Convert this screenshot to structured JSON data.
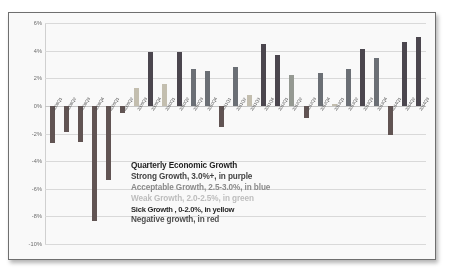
{
  "chart_data": {
    "type": "bar",
    "title": "Quarterly Economic Growth",
    "xlabel": "",
    "ylabel": "",
    "ylim": [
      -10,
      6
    ],
    "grid": true,
    "legend_position": "inside-center",
    "yticks": [
      "6%",
      "4%",
      "2%",
      "0%",
      "-2%",
      "-4%",
      "-6%",
      "-8%",
      "-10%"
    ],
    "ytick_values": [
      6,
      4,
      2,
      0,
      -2,
      -4,
      -6,
      -8,
      -10
    ],
    "categories": [
      "2008Q1",
      "2008Q2",
      "2008Q3",
      "2008Q4",
      "2009Q1",
      "2009Q2",
      "2009Q3",
      "2009Q4",
      "2010Q1",
      "2010Q2",
      "2010Q3",
      "2010Q4",
      "2011Q1",
      "2011Q2",
      "2011Q3",
      "2011Q4",
      "2012Q1",
      "2012Q2",
      "2012Q3",
      "2012Q4",
      "2013Q1",
      "2013Q2",
      "2013Q3",
      "2013Q4",
      "2014Q1",
      "2014Q2",
      "2014Q3"
    ],
    "values": [
      -2.7,
      -1.9,
      -2.6,
      -8.3,
      -5.4,
      -0.5,
      1.3,
      3.9,
      1.6,
      3.9,
      2.7,
      2.5,
      -1.5,
      2.8,
      0.8,
      4.5,
      3.7,
      2.2,
      -0.9,
      2.4,
      0.1,
      2.7,
      4.1,
      3.5,
      -2.1,
      4.6,
      5.0
    ],
    "colors": [
      "#e0302e",
      "#e0302e",
      "#e0302e",
      "#e0302e",
      "#e0302e",
      "#e0302e",
      "#ffc000",
      "#7030a0",
      "#ffc000",
      "#7030a0",
      "#4472c4",
      "#4472c4",
      "#e0302e",
      "#4472c4",
      "#ffc000",
      "#7030a0",
      "#7030a0",
      "#70ad47",
      "#e0302e",
      "#4472c4",
      "#ffc000",
      "#4472c4",
      "#7030a0",
      "#4472c4",
      "#e0302e",
      "#7030a0",
      "#7030a0"
    ],
    "series_legend": [
      {
        "label": "Strong Growth, 3.0%+, in purple",
        "color": "#7030a0",
        "range": "3.0+"
      },
      {
        "label": "Acceptable Growth, 2.5-3.0%, in blue",
        "color": "#4472c4",
        "range": "2.5-3.0"
      },
      {
        "label": "Weak Growth, 2.0-2.5%, in green",
        "color": "#70ad47",
        "range": "2.0-2.5"
      },
      {
        "label": "Sick Growth , 0-2.0%, in yellow",
        "color": "#ffc000",
        "range": "0-2.0"
      },
      {
        "label": "Negative growth, in red",
        "color": "#e0302e",
        "range": "<0"
      }
    ]
  }
}
